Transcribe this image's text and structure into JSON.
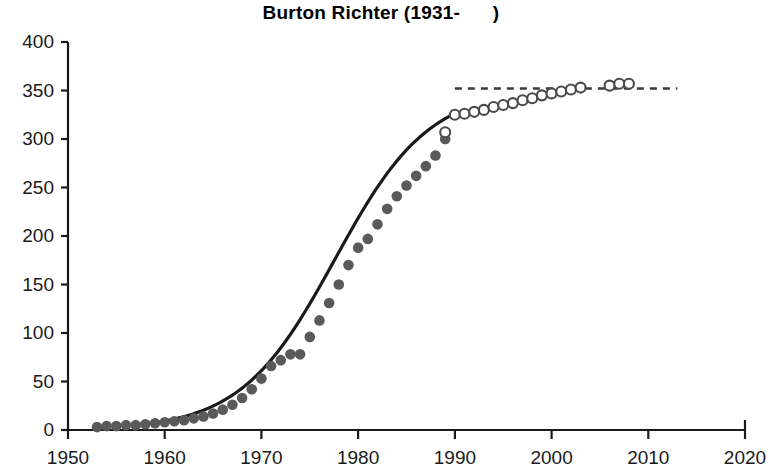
{
  "chart_data": {
    "type": "scatter",
    "title": "Burton Richter (1931-      )",
    "xlabel": "",
    "ylabel": "",
    "xlim": [
      1950,
      2020
    ],
    "ylim": [
      0,
      400
    ],
    "xticks": [
      1950,
      1960,
      1970,
      1980,
      1990,
      2000,
      2010,
      2020
    ],
    "xtick_labels": [
      "1950",
      "1960",
      "1970",
      "1980",
      "1990",
      "2000",
      "2010",
      "2020"
    ],
    "yticks": [
      0,
      50,
      100,
      150,
      200,
      250,
      300,
      350,
      400
    ],
    "ytick_labels": [
      "0",
      "50",
      "100",
      "150",
      "200",
      "250",
      "300",
      "350",
      "400"
    ],
    "grid": false,
    "legend": null,
    "colors": {
      "marker_filled": "#5a5a5a",
      "marker_open_stroke": "#4a4a4a",
      "curve": "#1a1a1a",
      "dashed": "#3a3a3a",
      "axis": "#1a1a1a"
    },
    "series": [
      {
        "name": "Measured (filled circles)",
        "marker": "filled-circle",
        "x": [
          1953,
          1954,
          1955,
          1956,
          1957,
          1958,
          1959,
          1960,
          1961,
          1962,
          1963,
          1964,
          1965,
          1966,
          1967,
          1968,
          1969,
          1970,
          1971,
          1972,
          1973,
          1974,
          1975,
          1976,
          1977,
          1978,
          1979,
          1980,
          1981,
          1982,
          1983,
          1984,
          1985,
          1986,
          1987,
          1988,
          1989
        ],
        "y": [
          3,
          4,
          4,
          5,
          5,
          6,
          7,
          8,
          9,
          10,
          12,
          14,
          17,
          21,
          26,
          33,
          42,
          53,
          66,
          72,
          78,
          78,
          96,
          113,
          131,
          150,
          170,
          188,
          197,
          212,
          228,
          241,
          252,
          262,
          272,
          283,
          300
        ]
      },
      {
        "name": "Later values (open circles)",
        "marker": "open-circle",
        "x": [
          1989,
          1990,
          1991,
          1992,
          1993,
          1994,
          1995,
          1996,
          1997,
          1998,
          1999,
          2000,
          2001,
          2002,
          2003,
          2006,
          2007,
          2008
        ],
        "y": [
          307,
          325,
          326,
          328,
          330,
          333,
          335,
          337,
          340,
          342,
          345,
          347,
          349,
          351,
          353,
          355,
          357,
          357
        ]
      }
    ],
    "fit_curve": {
      "name": "Sigmoid fit (solid line)",
      "style": "solid",
      "x_range": [
        1957,
        1990
      ],
      "plateau": 352
    },
    "extrapolation": {
      "name": "Extrapolation (dashed line)",
      "style": "dashed",
      "x_range": [
        1990,
        2013
      ],
      "y": 352
    }
  }
}
